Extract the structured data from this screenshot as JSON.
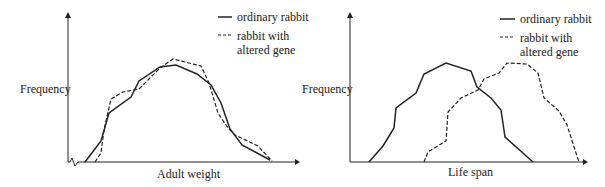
{
  "chart_data": [
    {
      "type": "line",
      "title": "",
      "xlabel": "Adult weight",
      "ylabel": "Frequency",
      "axis_break": true,
      "grid": false,
      "legend_position": "top-right",
      "series": [
        {
          "name": "ordinary rabbit",
          "style": "solid",
          "points": [
            [
              85,
              162
            ],
            [
              101,
              141
            ],
            [
              109,
              113
            ],
            [
              131,
              97
            ],
            [
              139,
              81
            ],
            [
              160,
              67
            ],
            [
              176,
              65
            ],
            [
              197,
              74
            ],
            [
              211,
              85
            ],
            [
              221,
              103
            ],
            [
              230,
              129
            ],
            [
              242,
              145
            ],
            [
              270,
              160
            ]
          ]
        },
        {
          "name": "rabbit with altered gene",
          "style": "dashed",
          "points": [
            [
              95,
              162
            ],
            [
              101,
              153
            ],
            [
              104,
              130
            ],
            [
              111,
              99
            ],
            [
              123,
              92
            ],
            [
              139,
              89
            ],
            [
              160,
              68
            ],
            [
              173,
              59
            ],
            [
              201,
              66
            ],
            [
              209,
              83
            ],
            [
              218,
              113
            ],
            [
              228,
              128
            ],
            [
              235,
              135
            ],
            [
              258,
              146
            ],
            [
              272,
              161
            ]
          ]
        }
      ]
    },
    {
      "type": "line",
      "title": "",
      "xlabel": "Life span",
      "ylabel": "Frequency",
      "grid": false,
      "legend_position": "top-right",
      "series": [
        {
          "name": "ordinary rabbit",
          "style": "solid",
          "points": [
            [
              369,
              162
            ],
            [
              383,
              146
            ],
            [
              394,
              128
            ],
            [
              396,
              108
            ],
            [
              416,
              93
            ],
            [
              424,
              74
            ],
            [
              446,
              63
            ],
            [
              471,
              71
            ],
            [
              477,
              87
            ],
            [
              491,
              98
            ],
            [
              501,
              110
            ],
            [
              505,
              137
            ],
            [
              533,
              162
            ]
          ]
        },
        {
          "name": "rabbit with altered gene",
          "style": "dashed",
          "points": [
            [
              424,
              162
            ],
            [
              428,
              152
            ],
            [
              446,
              141
            ],
            [
              448,
              112
            ],
            [
              461,
              98
            ],
            [
              478,
              90
            ],
            [
              484,
              79
            ],
            [
              499,
              73
            ],
            [
              507,
              63
            ],
            [
              527,
              64
            ],
            [
              538,
              73
            ],
            [
              544,
              98
            ],
            [
              559,
              111
            ],
            [
              567,
              125
            ],
            [
              575,
              150
            ],
            [
              579,
              162
            ]
          ]
        }
      ]
    }
  ],
  "left": {
    "ylabel": "Frequency",
    "xlabel": "Adult weight",
    "legend": [
      "ordinary rabbit",
      "rabbit with",
      "altered gene"
    ]
  },
  "right": {
    "ylabel": "Frequency",
    "xlabel": "Life span",
    "legend": [
      "ordinary rabbit",
      "rabbit with",
      "altered gene"
    ]
  }
}
